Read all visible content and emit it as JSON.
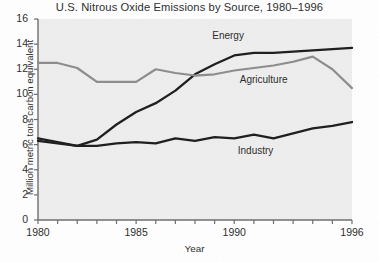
{
  "chart_data": {
    "type": "line",
    "title": "U.S. Nitrous Oxide Emissions by Source, 1980–1996",
    "xlabel": "Year",
    "ylabel": "Million metric tons carbon equivalent",
    "xlim": [
      1980,
      1996
    ],
    "ylim": [
      0,
      16
    ],
    "ytick_labels": [
      "0",
      "2",
      "4",
      "6",
      "8",
      "10",
      "12",
      "14",
      "16"
    ],
    "yticks": [
      0,
      2,
      4,
      6,
      8,
      10,
      12,
      14,
      16
    ],
    "xtick_labels": [
      "1980",
      "1985",
      "1990",
      "1996"
    ],
    "xticks_labeled": [
      1980,
      1985,
      1990,
      1996
    ],
    "xticks_all": [
      1980,
      1981,
      1982,
      1983,
      1984,
      1985,
      1986,
      1987,
      1988,
      1989,
      1990,
      1991,
      1992,
      1993,
      1994,
      1995,
      1996
    ],
    "grid": false,
    "legend_position": "inline-annotations",
    "x": [
      1980,
      1981,
      1982,
      1983,
      1984,
      1985,
      1986,
      1987,
      1988,
      1989,
      1990,
      1991,
      1992,
      1993,
      1994,
      1995,
      1996
    ],
    "series": [
      {
        "name": "Energy",
        "color": "#1c1c1c",
        "width": 2.3,
        "label_x": 1990.0,
        "label_y": 14.6,
        "values": [
          6.5,
          6.2,
          5.9,
          6.4,
          7.6,
          8.6,
          9.3,
          10.3,
          11.6,
          12.4,
          13.1,
          13.3,
          13.3,
          13.4,
          13.5,
          13.6,
          13.7
        ]
      },
      {
        "name": "Agriculture",
        "color": "#8c8c8c",
        "width": 2.2,
        "label_x": 1991.4,
        "label_y": 11.1,
        "values": [
          12.5,
          12.5,
          12.1,
          11.0,
          11.0,
          11.0,
          12.0,
          11.7,
          11.5,
          11.6,
          11.9,
          12.1,
          12.3,
          12.6,
          13.0,
          12.0,
          10.5
        ]
      },
      {
        "name": "Industry",
        "color": "#1c1c1c",
        "width": 2.3,
        "label_x": 1991.3,
        "label_y": 5.4,
        "values": [
          6.3,
          6.1,
          5.9,
          5.9,
          6.1,
          6.2,
          6.1,
          6.5,
          6.3,
          6.6,
          6.5,
          6.8,
          6.5,
          6.9,
          7.3,
          7.5,
          7.8
        ]
      }
    ],
    "colors": {
      "plot_background": "#eeeeee",
      "page_background": "#ffffff",
      "axis": "#6d6d6d",
      "text": "#2b2b2b",
      "dark_series": "#1c1c1c",
      "light_series": "#8c8c8c"
    }
  }
}
